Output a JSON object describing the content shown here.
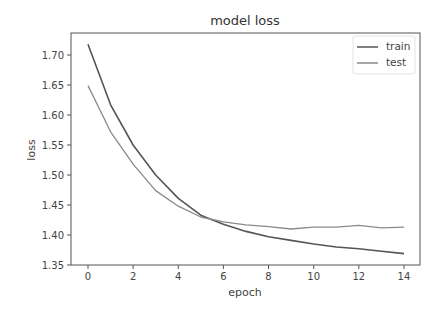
{
  "chart_data": {
    "type": "line",
    "title": "model loss",
    "xlabel": "epoch",
    "ylabel": "loss",
    "xlim": [
      -0.7,
      14.7
    ],
    "ylim": [
      1.35,
      1.737
    ],
    "xticks": [
      0,
      2,
      4,
      6,
      8,
      10,
      12,
      14
    ],
    "yticks": [
      1.35,
      1.4,
      1.45,
      1.5,
      1.55,
      1.6,
      1.65,
      1.7
    ],
    "ytick_labels": [
      "1.35",
      "1.40",
      "1.45",
      "1.50",
      "1.55",
      "1.60",
      "1.65",
      "1.70"
    ],
    "grid": false,
    "legend_position": "upper right",
    "x": [
      0,
      1,
      2,
      3,
      4,
      5,
      6,
      7,
      8,
      9,
      10,
      11,
      12,
      13,
      14
    ],
    "series": [
      {
        "name": "train",
        "color": "#555555",
        "values": [
          1.718,
          1.617,
          1.55,
          1.5,
          1.461,
          1.433,
          1.418,
          1.406,
          1.397,
          1.391,
          1.385,
          1.38,
          1.377,
          1.373,
          1.369
        ]
      },
      {
        "name": "test",
        "color": "#8a8a8a",
        "values": [
          1.649,
          1.572,
          1.518,
          1.474,
          1.448,
          1.43,
          1.422,
          1.417,
          1.414,
          1.41,
          1.413,
          1.413,
          1.416,
          1.412,
          1.413
        ]
      }
    ]
  },
  "legend": {
    "items": [
      {
        "label": "train"
      },
      {
        "label": "test"
      }
    ]
  }
}
